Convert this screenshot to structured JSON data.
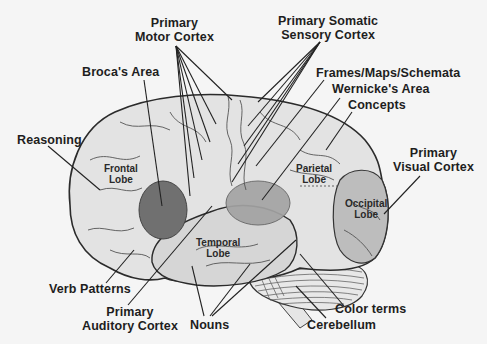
{
  "diagram": {
    "type": "labeled anatomical illustration",
    "colors": {
      "background": "#f5f5f5",
      "brain_fill": "#e2e2e2",
      "temporal_fill": "#d4d4d4",
      "occipital_fill": "#bdbdbd",
      "brocas_area_fill": "#707070",
      "wernickes_area_fill": "#a3a3a3",
      "outline": "#2b2b2b",
      "label_text": "#1e1e1e"
    },
    "lobes": {
      "frontal": [
        "Frontal",
        "Lobe"
      ],
      "parietal": [
        "Parietal",
        "Lobe"
      ],
      "temporal": [
        "Temporal",
        "Lobe"
      ],
      "occipital": [
        "Occipital",
        "Lobe"
      ]
    },
    "labels": {
      "primary_motor_cortex": [
        "Primary",
        "Motor Cortex"
      ],
      "primary_somatic_sensory_cortex": [
        "Primary Somatic",
        "Sensory Cortex"
      ],
      "brocas_area": "Broca's Area",
      "frames_maps_schemata": "Frames/Maps/Schemata",
      "wernickes_area": "Wernicke's Area",
      "concepts": "Concepts",
      "reasoning": "Reasoning",
      "primary_visual_cortex": [
        "Primary",
        "Visual Cortex"
      ],
      "verb_patterns": "Verb Patterns",
      "primary_auditory_cortex": [
        "Primary",
        "Auditory Cortex"
      ],
      "nouns": "Nouns",
      "color_terms": "Color terms",
      "cerebellum": "Cerebellum"
    }
  }
}
